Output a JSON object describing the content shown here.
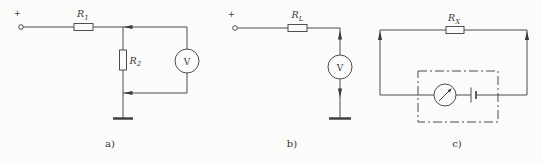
{
  "figure": {
    "colors": {
      "background": "#fbfbfa",
      "line": "#4d4d4d",
      "text": "#3a3a3a"
    },
    "circuits": [
      {
        "caption": "a)",
        "terminal_polarity": "+",
        "components": {
          "r1": {
            "base": "R",
            "sub": "1"
          },
          "r2": {
            "base": "R",
            "sub": "2"
          },
          "voltmeter": "V"
        }
      },
      {
        "caption": "b)",
        "terminal_polarity": "+",
        "components": {
          "rl": {
            "base": "R",
            "sub": "L"
          },
          "voltmeter": "V"
        }
      },
      {
        "caption": "c)",
        "components": {
          "rx": {
            "base": "R",
            "sub": "X"
          }
        }
      }
    ]
  }
}
